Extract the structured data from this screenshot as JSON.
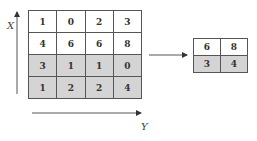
{
  "diagram": {
    "type": "max-pooling",
    "input_matrix": {
      "rows": [
        {
          "shaded": false,
          "values": [
            "1",
            "0",
            "2",
            "3"
          ]
        },
        {
          "shaded": false,
          "values": [
            "4",
            "6",
            "6",
            "8"
          ]
        },
        {
          "shaded": true,
          "values": [
            "3",
            "1",
            "1",
            "0"
          ]
        },
        {
          "shaded": true,
          "values": [
            "1",
            "2",
            "2",
            "4"
          ]
        }
      ]
    },
    "output_matrix": {
      "rows": [
        {
          "shaded": false,
          "values": [
            "6",
            "8"
          ]
        },
        {
          "shaded": true,
          "values": [
            "3",
            "4"
          ]
        }
      ]
    },
    "axes": {
      "x_label": "X",
      "y_label": "Y"
    },
    "colors": {
      "shaded_cell": "#d4d4d4",
      "border": "#555555",
      "arrow": "#333333"
    }
  }
}
